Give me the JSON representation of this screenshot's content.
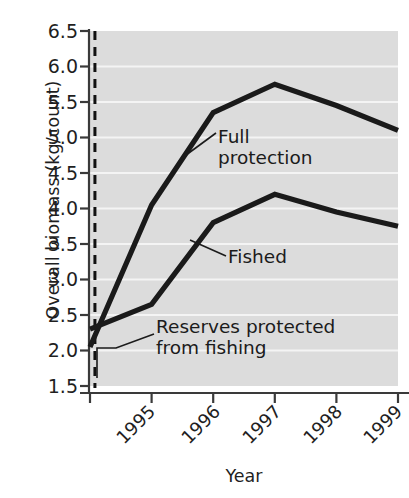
{
  "chart_data": {
    "type": "line",
    "title": "",
    "xlabel": "Year",
    "ylabel": "Overall biomass (kg/count)",
    "x": [
      "1995",
      "1996",
      "1997",
      "1998",
      "1999",
      "2000"
    ],
    "xlim": [
      1995,
      2000
    ],
    "ylim": [
      1.5,
      6.5
    ],
    "ytick_labels": [
      "6.5",
      "6.0",
      "5.5",
      "5.0",
      "4.5",
      "4.0",
      "3.5",
      "3.0",
      "2.5",
      "2.0",
      "1.5"
    ],
    "ytick_values": [
      6.5,
      6.0,
      5.5,
      5.0,
      4.5,
      4.0,
      3.5,
      3.0,
      2.5,
      2.0,
      1.5
    ],
    "xtick_labels": [
      "1995",
      "1996",
      "1997",
      "1998",
      "1999",
      "2000"
    ],
    "grid": "horizontal-white-on-gray",
    "legend_position": "inline-annotations",
    "plot_background": "#dddddd",
    "gridline_color": "#f5f5f5",
    "line_color": "#1a1a1a",
    "series": [
      {
        "name": "Full protection",
        "values": [
          2.05,
          4.05,
          5.35,
          5.75,
          5.45,
          5.1
        ]
      },
      {
        "name": "Fished",
        "values": [
          2.3,
          2.65,
          3.8,
          4.2,
          3.95,
          3.75
        ]
      }
    ],
    "annotations": [
      {
        "name": "full-protection",
        "text": "Full\nprotection",
        "points_to_year": 1996.5
      },
      {
        "name": "fished",
        "text": "Fished",
        "points_to_year": 1996.6
      },
      {
        "name": "reserves-protected",
        "text": "Reserves protected\nfrom fishing",
        "points_to_year": 1995.08
      }
    ],
    "marker_line": {
      "name": "reserve-establishment",
      "style": "dashed-vertical",
      "x_value": 1995.08
    }
  }
}
